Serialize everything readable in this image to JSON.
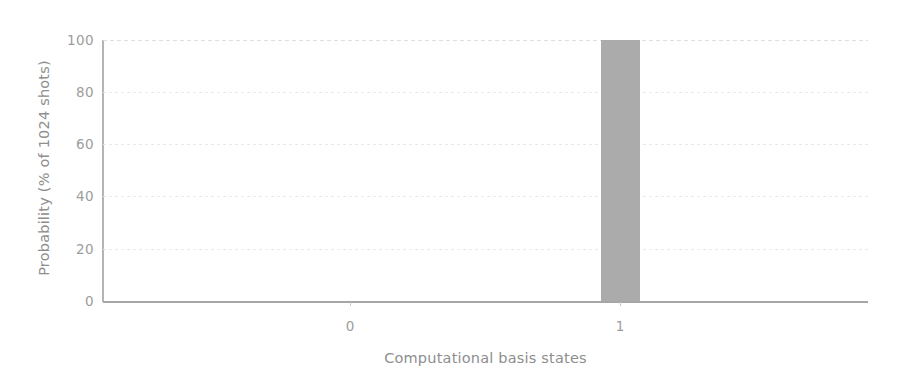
{
  "chart_data": {
    "type": "bar",
    "title": "",
    "xlabel": "Computational basis states",
    "ylabel": "Probability (% of 1024 shots)",
    "categories": [
      "0",
      "1"
    ],
    "values": [
      0,
      100
    ],
    "series": [
      {
        "name": "Measurement outcome probability",
        "values": [
          0,
          100
        ]
      }
    ],
    "ylim": [
      0,
      100
    ],
    "yticks": [
      0,
      20,
      40,
      60,
      80,
      100
    ],
    "ytick_labels": [
      "0",
      "20",
      "40",
      "60",
      "80",
      "100"
    ],
    "xtick_labels": [
      "0",
      "1"
    ],
    "grid": true,
    "grid_axis": "y",
    "legend": false,
    "legend_position": "none",
    "bar_color": "#ababab",
    "axis_color": "#a6a6a6",
    "gridline_color": "#e8e8e8",
    "text_color": "#9d9d9d",
    "background_color": "#ffffff",
    "annotations": []
  },
  "figure": {
    "width": 899,
    "height": 386
  }
}
